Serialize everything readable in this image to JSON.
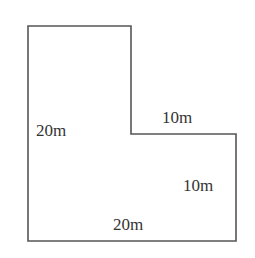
{
  "diagram": {
    "type": "L-shaped figure with side lengths",
    "stroke_color": "#555555",
    "text_color": "#333333",
    "vertices": [
      [
        28,
        26
      ],
      [
        131,
        26
      ],
      [
        131,
        134
      ],
      [
        236,
        134
      ],
      [
        236,
        241
      ],
      [
        28,
        241
      ]
    ],
    "labels": {
      "left_side": "20m",
      "inner_top": "10m",
      "right_side": "10m",
      "bottom_side": "20m"
    }
  }
}
